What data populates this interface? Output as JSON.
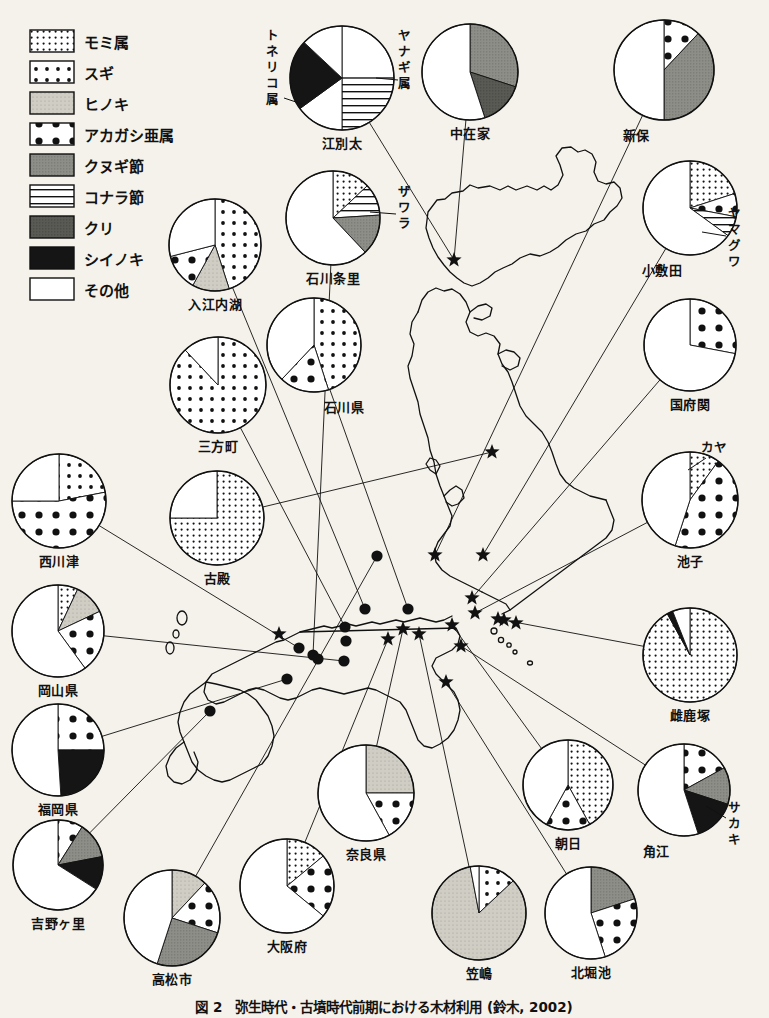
{
  "figure": {
    "caption": "図 2　弥生時代・古墳時代前期における木材利用 (鈴木, 2002)",
    "background_color": "#f4f2ea",
    "ink_color": "#111111"
  },
  "legend": {
    "title": "",
    "items": [
      {
        "label": "モミ属",
        "pattern": "fine-dots",
        "color": "#ffffff"
      },
      {
        "label": "スギ",
        "pattern": "medium-dots",
        "color": "#ffffff"
      },
      {
        "label": "ヒノキ",
        "pattern": "light-gray",
        "color": "#cccac2"
      },
      {
        "label": "アカガシ亜属",
        "pattern": "big-dots",
        "color": "#ffffff"
      },
      {
        "label": "クヌギ節",
        "pattern": "mid-gray",
        "color": "#8e8e88"
      },
      {
        "label": "コナラ節",
        "pattern": "h-lines",
        "color": "#ffffff"
      },
      {
        "label": "クリ",
        "pattern": "dark-gray",
        "color": "#595954"
      },
      {
        "label": "シイノキ",
        "pattern": "black",
        "color": "#141414"
      },
      {
        "label": "その他",
        "pattern": "white",
        "color": "#ffffff"
      }
    ]
  },
  "extra_callouts": [
    {
      "label": "トネリコ属",
      "orientation": "vertical",
      "site": "江別太"
    },
    {
      "label": "ヤナギ属",
      "orientation": "vertical",
      "site": "江別太"
    },
    {
      "label": "ザワラ",
      "orientation": "vertical",
      "site": "石川条里"
    },
    {
      "label": "ヤマグワ",
      "orientation": "vertical",
      "site": "小敷田"
    },
    {
      "label": "カヤ",
      "orientation": "horizontal",
      "site": "池子"
    },
    {
      "label": "サカキ",
      "orientation": "vertical",
      "site": "角江"
    }
  ],
  "chart_data": {
    "type": "pie",
    "title": "弥生時代・古墳時代前期における木材利用",
    "legend_position": "top-left",
    "value_unit": "percent",
    "categories": [
      "モミ属",
      "スギ",
      "ヒノキ",
      "アカガシ亜属",
      "クヌギ節",
      "コナラ節",
      "クリ",
      "シイノキ",
      "その他"
    ],
    "charts": [
      {
        "name": "江別太",
        "cx": 342,
        "cy": 78,
        "r": 52,
        "label_pos": "bottom",
        "slices": [
          {
            "cat": "その他",
            "value": 25
          },
          {
            "cat": "コナラ節",
            "value": 25
          },
          {
            "cat": "その他",
            "value": 15
          },
          {
            "cat": "シイノキ",
            "value": 22
          },
          {
            "cat": "その他",
            "value": 13
          }
        ]
      },
      {
        "name": "中在家",
        "cx": 470,
        "cy": 72,
        "r": 48,
        "label_pos": "bottom",
        "slices": [
          {
            "cat": "クヌギ節",
            "value": 30
          },
          {
            "cat": "クリ",
            "value": 15
          },
          {
            "cat": "その他",
            "value": 55
          }
        ]
      },
      {
        "name": "新保",
        "cx": 664,
        "cy": 70,
        "r": 50,
        "label_pos": "bottom-left",
        "slices": [
          {
            "cat": "アカガシ亜属",
            "value": 12
          },
          {
            "cat": "クヌギ節",
            "value": 38
          },
          {
            "cat": "その他",
            "value": 50
          }
        ]
      },
      {
        "name": "小敷田",
        "cx": 690,
        "cy": 208,
        "r": 47,
        "label_pos": "bottom-left",
        "slices": [
          {
            "cat": "モミ属",
            "value": 20
          },
          {
            "cat": "アカガシ亜属",
            "value": 8
          },
          {
            "cat": "コナラ節",
            "value": 7
          },
          {
            "cat": "その他",
            "value": 65
          }
        ]
      },
      {
        "name": "国府関",
        "cx": 690,
        "cy": 345,
        "r": 46,
        "label_pos": "bottom",
        "slices": [
          {
            "cat": "アカガシ亜属",
            "value": 28
          },
          {
            "cat": "その他",
            "value": 72
          }
        ]
      },
      {
        "name": "池子",
        "cx": 690,
        "cy": 500,
        "r": 48,
        "label_pos": "bottom",
        "slices": [
          {
            "cat": "モミ属",
            "value": 10
          },
          {
            "cat": "アカガシ亜属",
            "value": 45
          },
          {
            "cat": "その他",
            "value": 45
          }
        ]
      },
      {
        "name": "雌鹿塚",
        "cx": 690,
        "cy": 655,
        "r": 47,
        "label_pos": "bottom",
        "slices": [
          {
            "cat": "モミ属",
            "value": 92
          },
          {
            "cat": "シイノキ",
            "value": 2
          },
          {
            "cat": "その他",
            "value": 6
          }
        ]
      },
      {
        "name": "角江",
        "cx": 684,
        "cy": 790,
        "r": 46,
        "label_pos": "bottom-left",
        "slices": [
          {
            "cat": "アカガシ亜属",
            "value": 17
          },
          {
            "cat": "クヌギ節",
            "value": 13
          },
          {
            "cat": "シイノキ",
            "value": 15
          },
          {
            "cat": "その他",
            "value": 55
          }
        ]
      },
      {
        "name": "朝日",
        "cx": 568,
        "cy": 785,
        "r": 45,
        "label_pos": "bottom",
        "slices": [
          {
            "cat": "モミ属",
            "value": 42
          },
          {
            "cat": "アカガシ亜属",
            "value": 16
          },
          {
            "cat": "その他",
            "value": 42
          }
        ]
      },
      {
        "name": "北堀池",
        "cx": 591,
        "cy": 913,
        "r": 46,
        "label_pos": "bottom",
        "slices": [
          {
            "cat": "クヌギ節",
            "value": 20
          },
          {
            "cat": "アカガシ亜属",
            "value": 25
          },
          {
            "cat": "その他",
            "value": 55
          }
        ]
      },
      {
        "name": "笠嶋",
        "cx": 479,
        "cy": 913,
        "r": 47,
        "label_pos": "bottom",
        "slices": [
          {
            "cat": "スギ",
            "value": 13
          },
          {
            "cat": "ヒノキ",
            "value": 84
          },
          {
            "cat": "その他",
            "value": 3
          }
        ]
      },
      {
        "name": "奈良県",
        "cx": 366,
        "cy": 793,
        "r": 48,
        "label_pos": "bottom",
        "slices": [
          {
            "cat": "ヒノキ",
            "value": 25
          },
          {
            "cat": "アカガシ亜属",
            "value": 17
          },
          {
            "cat": "その他",
            "value": 58
          }
        ]
      },
      {
        "name": "大阪府",
        "cx": 287,
        "cy": 886,
        "r": 47,
        "label_pos": "bottom",
        "slices": [
          {
            "cat": "モミ属",
            "value": 14
          },
          {
            "cat": "アカガシ亜属",
            "value": 22
          },
          {
            "cat": "その他",
            "value": 64
          }
        ]
      },
      {
        "name": "高松市",
        "cx": 172,
        "cy": 918,
        "r": 48,
        "label_pos": "bottom",
        "slices": [
          {
            "cat": "ヒノキ",
            "value": 12
          },
          {
            "cat": "アカガシ亜属",
            "value": 18
          },
          {
            "cat": "クヌギ節",
            "value": 25
          },
          {
            "cat": "その他",
            "value": 45
          }
        ]
      },
      {
        "name": "吉野ヶ里",
        "cx": 58,
        "cy": 865,
        "r": 45,
        "label_pos": "bottom",
        "slices": [
          {
            "cat": "アカガシ亜属",
            "value": 9
          },
          {
            "cat": "クヌギ節",
            "value": 13
          },
          {
            "cat": "シイノキ",
            "value": 12
          },
          {
            "cat": "その他",
            "value": 66
          }
        ]
      },
      {
        "name": "福岡県",
        "cx": 58,
        "cy": 750,
        "r": 46,
        "label_pos": "bottom",
        "slices": [
          {
            "cat": "アカガシ亜属",
            "value": 25
          },
          {
            "cat": "シイノキ",
            "value": 24
          },
          {
            "cat": "その他",
            "value": 51
          }
        ]
      },
      {
        "name": "岡山県",
        "cx": 58,
        "cy": 631,
        "r": 46,
        "label_pos": "bottom",
        "slices": [
          {
            "cat": "モミ属",
            "value": 7
          },
          {
            "cat": "ヒノキ",
            "value": 11
          },
          {
            "cat": "アカガシ亜属",
            "value": 22
          },
          {
            "cat": "その他",
            "value": 60
          }
        ]
      },
      {
        "name": "西川津",
        "cx": 59,
        "cy": 501,
        "r": 47,
        "label_pos": "bottom",
        "slices": [
          {
            "cat": "スギ",
            "value": 22
          },
          {
            "cat": "アカガシ亜属",
            "value": 53
          },
          {
            "cat": "その他",
            "value": 25
          }
        ]
      },
      {
        "name": "古殿",
        "cx": 217,
        "cy": 518,
        "r": 47,
        "label_pos": "bottom",
        "slices": [
          {
            "cat": "モミ属",
            "value": 75
          },
          {
            "cat": "その他",
            "value": 25
          }
        ]
      },
      {
        "name": "三方町",
        "cx": 218,
        "cy": 385,
        "r": 48,
        "label_pos": "bottom",
        "slices": [
          {
            "cat": "スギ",
            "value": 88
          },
          {
            "cat": "その他",
            "value": 12
          }
        ]
      },
      {
        "name": "入江内湖",
        "cx": 215,
        "cy": 245,
        "r": 46,
        "label_pos": "bottom",
        "slices": [
          {
            "cat": "スギ",
            "value": 45
          },
          {
            "cat": "ヒノキ",
            "value": 13
          },
          {
            "cat": "アカガシ亜属",
            "value": 13
          },
          {
            "cat": "その他",
            "value": 29
          }
        ]
      },
      {
        "name": "石川県",
        "cx": 314,
        "cy": 345,
        "r": 47,
        "label_pos": "bottom-right",
        "slices": [
          {
            "cat": "スギ",
            "value": 45
          },
          {
            "cat": "アカガシ亜属",
            "value": 17
          },
          {
            "cat": "その他",
            "value": 38
          }
        ]
      },
      {
        "name": "石川条里",
        "cx": 333,
        "cy": 218,
        "r": 47,
        "label_pos": "bottom",
        "slices": [
          {
            "cat": "モミ属",
            "value": 13
          },
          {
            "cat": "コナラ節",
            "value": 11
          },
          {
            "cat": "クヌギ節",
            "value": 14
          },
          {
            "cat": "その他",
            "value": 62
          }
        ]
      }
    ],
    "map_markers": {
      "star_count": 16,
      "dot_count": 11,
      "stars": [
        [
          454,
          260
        ],
        [
          492,
          452
        ],
        [
          435,
          555
        ],
        [
          483,
          555
        ],
        [
          472,
          598
        ],
        [
          475,
          613
        ],
        [
          498,
          619
        ],
        [
          504,
          620
        ],
        [
          516,
          623
        ],
        [
          452,
          625
        ],
        [
          403,
          629
        ],
        [
          419,
          634
        ],
        [
          388,
          639
        ],
        [
          461,
          646
        ],
        [
          446,
          682
        ],
        [
          279,
          634
        ]
      ],
      "dots": [
        [
          377,
          556
        ],
        [
          365,
          609
        ],
        [
          408,
          609
        ],
        [
          345,
          627
        ],
        [
          346,
          641
        ],
        [
          299,
          648
        ],
        [
          313,
          655
        ],
        [
          318,
          659
        ],
        [
          344,
          661
        ],
        [
          287,
          679
        ],
        [
          210,
          711
        ]
      ]
    }
  }
}
